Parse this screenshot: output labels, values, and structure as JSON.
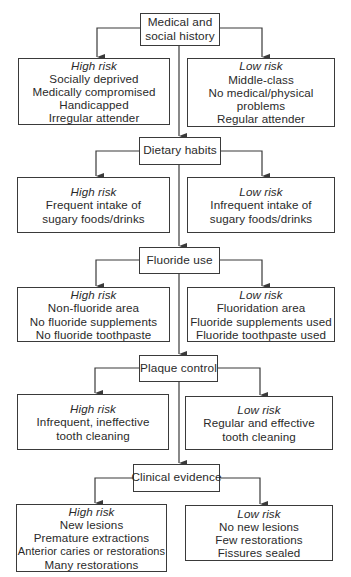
{
  "diagram": {
    "steps": [
      {
        "id": "medical-social-history",
        "label_lines": [
          "Medical and",
          "social history"
        ],
        "high": {
          "title": "High risk",
          "lines": [
            "Socially deprived",
            "Medically compromised",
            "Handicapped",
            "Irregular attender"
          ]
        },
        "low": {
          "title": "Low risk",
          "lines": [
            "Middle-class",
            "No medical/physical",
            "problems",
            "Regular attender"
          ]
        }
      },
      {
        "id": "dietary-habits",
        "label_lines": [
          "Dietary habits"
        ],
        "high": {
          "title": "High risk",
          "lines": [
            "Frequent intake of",
            "sugary foods/drinks"
          ]
        },
        "low": {
          "title": "Low risk",
          "lines": [
            "Infrequent intake of",
            "sugary foods/drinks"
          ]
        }
      },
      {
        "id": "fluoride-use",
        "label_lines": [
          "Fluoride use"
        ],
        "high": {
          "title": "High risk",
          "lines": [
            "Non-fluoride area",
            "No fluoride supplements",
            "No fluoride toothpaste"
          ]
        },
        "low": {
          "title": "Low risk",
          "lines": [
            "Fluoridation area",
            "Fluoride supplements used",
            "Fluoride toothpaste used"
          ]
        }
      },
      {
        "id": "plaque-control",
        "label_lines": [
          "Plaque control"
        ],
        "high": {
          "title": "High risk",
          "lines": [
            "Infrequent, ineffective",
            "tooth cleaning"
          ]
        },
        "low": {
          "title": "Low risk",
          "lines": [
            "Regular and effective",
            "tooth cleaning"
          ]
        }
      },
      {
        "id": "clinical-evidence",
        "label_lines": [
          "Clinical evidence"
        ],
        "high": {
          "title": "High risk",
          "lines": [
            "New lesions",
            "Premature extractions",
            "Anterior caries or restorations",
            "Many restorations"
          ]
        },
        "low": {
          "title": "Low risk",
          "lines": [
            "No new lesions",
            "Few restorations",
            "Fissures sealed"
          ]
        }
      }
    ],
    "colors": {
      "line": "#3a3a3a",
      "text": "#2a2a2a",
      "background": "#ffffff"
    }
  }
}
